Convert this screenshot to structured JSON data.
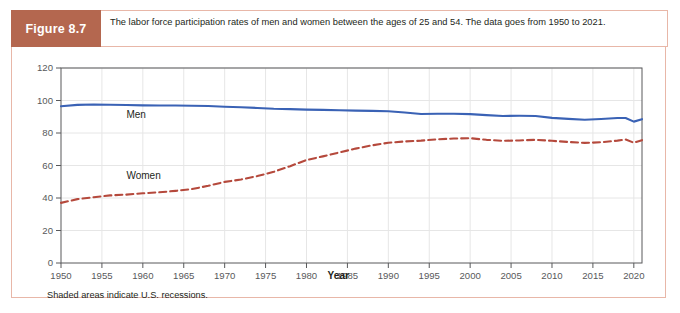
{
  "figure": {
    "tag": "Figure 8.7",
    "caption": "The labor force participation rates of men and women between the ages of 25 and 54. The data goes from 1950 to 2021.",
    "footnote": "Shaded areas indicate U.S. recessions."
  },
  "colors": {
    "header_band": "#b4674f",
    "card_border": "#e8b7a8",
    "men_line": "#3a62b5",
    "women_line": "#b5493c",
    "grid": "#e6e6e6",
    "axis": "#58595b",
    "text": "#231f20"
  },
  "chart_data": {
    "type": "line",
    "title": "",
    "xlabel": "Year",
    "ylabel": "",
    "xlim": [
      1950,
      2021
    ],
    "ylim": [
      0,
      120
    ],
    "ytick_labels": [
      "0",
      "20",
      "40",
      "60",
      "80",
      "100",
      "120"
    ],
    "yticks": [
      0,
      20,
      40,
      60,
      80,
      100,
      120
    ],
    "xtick_labels": [
      "1950",
      "1955",
      "1960",
      "1965",
      "1970",
      "1975",
      "1980",
      "1985",
      "1990",
      "1995",
      "2000",
      "2005",
      "2010",
      "2015",
      "2020"
    ],
    "xticks": [
      1950,
      1955,
      1960,
      1965,
      1970,
      1975,
      1980,
      1985,
      1990,
      1995,
      2000,
      2005,
      2010,
      2015,
      2020
    ],
    "grid": true,
    "legend_position": "inline-annotations",
    "annotations": [
      {
        "text": "Men",
        "x": 1958,
        "y": 89
      },
      {
        "text": "Women",
        "x": 1958,
        "y": 52
      }
    ],
    "series": [
      {
        "name": "Men",
        "style": "solid",
        "color": "#3a62b5",
        "x": [
          1950,
          1952,
          1954,
          1956,
          1958,
          1960,
          1962,
          1964,
          1966,
          1968,
          1970,
          1972,
          1974,
          1976,
          1978,
          1980,
          1982,
          1984,
          1986,
          1988,
          1990,
          1992,
          1994,
          1996,
          1998,
          2000,
          2002,
          2004,
          2006,
          2008,
          2010,
          2012,
          2014,
          2016,
          2018,
          2019,
          2020,
          2021
        ],
        "values": [
          96.5,
          97.3,
          97.5,
          97.4,
          97.2,
          97.0,
          96.9,
          96.9,
          96.8,
          96.6,
          96.2,
          95.8,
          95.4,
          94.9,
          94.7,
          94.4,
          94.2,
          94.0,
          93.8,
          93.6,
          93.4,
          92.6,
          91.7,
          91.8,
          91.8,
          91.6,
          91.0,
          90.5,
          90.6,
          90.5,
          89.3,
          88.7,
          88.2,
          88.6,
          89.2,
          89.2,
          87.0,
          88.5
        ]
      },
      {
        "name": "Women",
        "style": "dashed",
        "color": "#b5493c",
        "x": [
          1950,
          1952,
          1954,
          1956,
          1958,
          1960,
          1962,
          1964,
          1966,
          1968,
          1970,
          1972,
          1974,
          1976,
          1978,
          1980,
          1982,
          1984,
          1986,
          1988,
          1990,
          1992,
          1994,
          1996,
          1998,
          2000,
          2002,
          2004,
          2006,
          2008,
          2010,
          2012,
          2014,
          2016,
          2018,
          2019,
          2020,
          2021
        ],
        "values": [
          37.0,
          39.3,
          40.5,
          41.6,
          42.1,
          42.9,
          43.5,
          44.4,
          45.5,
          47.5,
          49.9,
          51.4,
          53.5,
          56.1,
          59.6,
          63.4,
          65.6,
          68.0,
          70.4,
          72.4,
          74.0,
          74.8,
          75.3,
          76.1,
          76.6,
          76.8,
          75.8,
          75.2,
          75.4,
          75.8,
          75.2,
          74.5,
          73.9,
          74.3,
          75.3,
          76.0,
          74.0,
          75.6
        ]
      }
    ]
  }
}
